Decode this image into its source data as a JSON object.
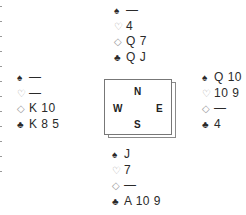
{
  "suit_symbols": {
    "spades": "♠",
    "hearts": "♡",
    "diamonds": "◇",
    "clubs": "♣"
  },
  "hands": {
    "north": {
      "spades": "—",
      "hearts": "4",
      "diamonds": "Q 7",
      "clubs": "Q J"
    },
    "west": {
      "spades": "—",
      "hearts": "—",
      "diamonds": "K 10",
      "clubs": "K 8 5"
    },
    "east": {
      "spades": "Q 10",
      "hearts": "10 9",
      "diamonds": "—",
      "clubs": "4"
    },
    "south": {
      "spades": "J",
      "hearts": "7",
      "diamonds": "—",
      "clubs": "A 10 9"
    }
  },
  "compass": {
    "north": "N",
    "west": "W",
    "east": "E",
    "south": "S"
  }
}
